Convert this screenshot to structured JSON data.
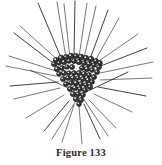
{
  "plate": {
    "background_color": "#ffffff",
    "ink_color": "#1d1d1d"
  },
  "caption": {
    "text": "Figure 133",
    "label": "Figure",
    "number": "133"
  },
  "illustration": {
    "subject_name": "radiolarian-skeleton",
    "description": "Spiny radiolarian-like microorganism with a dense beaded triangular central skeleton and long straight radiating spicules",
    "center": {
      "x": 78,
      "y": 74
    },
    "ray_color": "#1d1d1d",
    "bead_fill": "#3a3a3a",
    "bead_outline": "#101010",
    "rays": [
      {
        "x1": 62,
        "y1": 60,
        "x2": 38,
        "y2": 3
      },
      {
        "x1": 66,
        "y1": 58,
        "x2": 57,
        "y2": 2
      },
      {
        "x1": 70,
        "y1": 58,
        "x2": 64,
        "y2": 4
      },
      {
        "x1": 74,
        "y1": 57,
        "x2": 75,
        "y2": 1
      },
      {
        "x1": 79,
        "y1": 57,
        "x2": 87,
        "y2": 3
      },
      {
        "x1": 84,
        "y1": 58,
        "x2": 96,
        "y2": 6
      },
      {
        "x1": 90,
        "y1": 59,
        "x2": 108,
        "y2": 10
      },
      {
        "x1": 95,
        "y1": 61,
        "x2": 119,
        "y2": 18
      },
      {
        "x1": 60,
        "y1": 62,
        "x2": 20,
        "y2": 26
      },
      {
        "x1": 57,
        "y1": 66,
        "x2": 14,
        "y2": 33
      },
      {
        "x1": 56,
        "y1": 71,
        "x2": 9,
        "y2": 56
      },
      {
        "x1": 56,
        "y1": 76,
        "x2": 6,
        "y2": 66
      },
      {
        "x1": 58,
        "y1": 82,
        "x2": 10,
        "y2": 86
      },
      {
        "x1": 60,
        "y1": 88,
        "x2": 14,
        "y2": 99
      },
      {
        "x1": 64,
        "y1": 95,
        "x2": 26,
        "y2": 118
      },
      {
        "x1": 69,
        "y1": 101,
        "x2": 44,
        "y2": 131
      },
      {
        "x1": 74,
        "y1": 105,
        "x2": 62,
        "y2": 142
      },
      {
        "x1": 79,
        "y1": 106,
        "x2": 82,
        "y2": 144
      },
      {
        "x1": 84,
        "y1": 104,
        "x2": 100,
        "y2": 139
      },
      {
        "x1": 89,
        "y1": 100,
        "x2": 116,
        "y2": 128
      },
      {
        "x1": 94,
        "y1": 94,
        "x2": 132,
        "y2": 112
      },
      {
        "x1": 98,
        "y1": 87,
        "x2": 146,
        "y2": 96
      },
      {
        "x1": 100,
        "y1": 80,
        "x2": 152,
        "y2": 78
      },
      {
        "x1": 100,
        "y1": 73,
        "x2": 153,
        "y2": 62
      },
      {
        "x1": 98,
        "y1": 67,
        "x2": 147,
        "y2": 48
      },
      {
        "x1": 96,
        "y1": 63,
        "x2": 138,
        "y2": 34
      },
      {
        "x1": 72,
        "y1": 90,
        "x2": 30,
        "y2": 70
      },
      {
        "x1": 86,
        "y1": 92,
        "x2": 128,
        "y2": 72
      },
      {
        "x1": 79,
        "y1": 96,
        "x2": 52,
        "y2": 139
      },
      {
        "x1": 81,
        "y1": 95,
        "x2": 108,
        "y2": 136
      }
    ],
    "beads": [
      {
        "x": 56,
        "y": 60,
        "r": 2.6
      },
      {
        "x": 61,
        "y": 58,
        "r": 2.8
      },
      {
        "x": 66,
        "y": 57,
        "r": 2.5
      },
      {
        "x": 71,
        "y": 56,
        "r": 2.7
      },
      {
        "x": 76,
        "y": 56,
        "r": 2.5
      },
      {
        "x": 81,
        "y": 57,
        "r": 2.8
      },
      {
        "x": 86,
        "y": 58,
        "r": 2.6
      },
      {
        "x": 91,
        "y": 59,
        "r": 2.7
      },
      {
        "x": 96,
        "y": 61,
        "r": 2.5
      },
      {
        "x": 100,
        "y": 63,
        "r": 2.4
      },
      {
        "x": 54,
        "y": 64,
        "r": 2.5
      },
      {
        "x": 59,
        "y": 63,
        "r": 2.3
      },
      {
        "x": 64,
        "y": 62,
        "r": 2.6
      },
      {
        "x": 69,
        "y": 61,
        "r": 2.4
      },
      {
        "x": 74,
        "y": 61,
        "r": 2.5
      },
      {
        "x": 79,
        "y": 62,
        "r": 2.7
      },
      {
        "x": 84,
        "y": 63,
        "r": 2.5
      },
      {
        "x": 89,
        "y": 64,
        "r": 2.6
      },
      {
        "x": 94,
        "y": 65,
        "r": 2.4
      },
      {
        "x": 99,
        "y": 67,
        "r": 2.5
      },
      {
        "x": 57,
        "y": 69,
        "r": 2.6
      },
      {
        "x": 62,
        "y": 68,
        "r": 2.4
      },
      {
        "x": 67,
        "y": 67,
        "r": 2.3
      },
      {
        "x": 72,
        "y": 67,
        "r": 2.5
      },
      {
        "x": 82,
        "y": 68,
        "r": 2.5
      },
      {
        "x": 87,
        "y": 69,
        "r": 2.6
      },
      {
        "x": 92,
        "y": 70,
        "r": 2.4
      },
      {
        "x": 97,
        "y": 72,
        "r": 2.5
      },
      {
        "x": 59,
        "y": 74,
        "r": 2.4
      },
      {
        "x": 64,
        "y": 73,
        "r": 2.6
      },
      {
        "x": 69,
        "y": 73,
        "r": 2.3
      },
      {
        "x": 74,
        "y": 73,
        "r": 2.4
      },
      {
        "x": 79,
        "y": 73,
        "r": 2.5
      },
      {
        "x": 84,
        "y": 74,
        "r": 2.6
      },
      {
        "x": 89,
        "y": 75,
        "r": 2.4
      },
      {
        "x": 94,
        "y": 77,
        "r": 2.5
      },
      {
        "x": 63,
        "y": 79,
        "r": 2.5
      },
      {
        "x": 68,
        "y": 78,
        "r": 2.4
      },
      {
        "x": 73,
        "y": 78,
        "r": 2.6
      },
      {
        "x": 78,
        "y": 78,
        "r": 2.3
      },
      {
        "x": 83,
        "y": 79,
        "r": 2.5
      },
      {
        "x": 88,
        "y": 80,
        "r": 2.6
      },
      {
        "x": 92,
        "y": 82,
        "r": 2.4
      },
      {
        "x": 66,
        "y": 84,
        "r": 2.5
      },
      {
        "x": 71,
        "y": 83,
        "r": 2.4
      },
      {
        "x": 76,
        "y": 83,
        "r": 2.6
      },
      {
        "x": 81,
        "y": 84,
        "r": 2.5
      },
      {
        "x": 86,
        "y": 85,
        "r": 2.4
      },
      {
        "x": 90,
        "y": 87,
        "r": 2.5
      },
      {
        "x": 70,
        "y": 89,
        "r": 2.5
      },
      {
        "x": 75,
        "y": 88,
        "r": 2.6
      },
      {
        "x": 80,
        "y": 89,
        "r": 2.4
      },
      {
        "x": 85,
        "y": 90,
        "r": 2.5
      },
      {
        "x": 73,
        "y": 94,
        "r": 2.6
      },
      {
        "x": 78,
        "y": 94,
        "r": 2.5
      },
      {
        "x": 83,
        "y": 95,
        "r": 2.4
      },
      {
        "x": 76,
        "y": 99,
        "r": 2.6
      },
      {
        "x": 81,
        "y": 100,
        "r": 2.5
      },
      {
        "x": 79,
        "y": 104,
        "r": 2.4
      }
    ]
  }
}
